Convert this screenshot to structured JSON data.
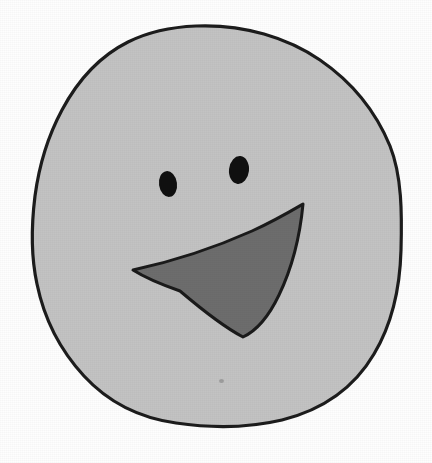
{
  "artwork": {
    "title": "Hand-drawn smiley face",
    "medium": "scanned line drawing",
    "canvas": {
      "width": 432,
      "height": 463
    },
    "background_color": "#fefefe"
  },
  "palette": {
    "background": "#fefefe",
    "face_fill": "#c3c3c3",
    "outline_stroke": "#1c1c1c",
    "eye_fill": "#101010",
    "mouth_fill": "#6d6d6d",
    "mouth_stroke": "#1a1a1a",
    "speck": "#8a8a8a"
  },
  "shapes": {
    "face": {
      "name": "face-outline",
      "description": "irregular hand-drawn roundish head outline",
      "fill": "#c3c3c3",
      "stroke": "#1c1c1c",
      "stroke_width": 3.2,
      "bounds": {
        "left": 32,
        "top": 25,
        "right": 402,
        "bottom": 427
      },
      "path": "M 196 26 C 244 24 288 38 320 60 C 352 82 376 112 390 146 C 402 176 402 214 401 250 C 400 288 392 324 374 354 C 354 388 322 410 282 420 C 248 428 210 428 176 423 C 140 418 108 402 84 376 C 60 350 44 318 37 284 C 30 252 32 220 35 196 C 39 166 48 136 62 110 C 78 80 100 56 128 42 C 150 31 172 27 196 26 Z"
    },
    "eye_left": {
      "name": "left-eye",
      "description": "small dark ellipse, lower and to the left",
      "fill": "#101010",
      "cx": 168,
      "cy": 184,
      "rx": 9,
      "ry": 13,
      "rotation": -8
    },
    "eye_right": {
      "name": "right-eye",
      "description": "slightly larger dark ellipse, higher and to the right",
      "fill": "#101010",
      "cx": 239,
      "cy": 170,
      "rx": 10,
      "ry": 14,
      "rotation": 6
    },
    "mouth": {
      "name": "mouth",
      "description": "curved crescent / triangular smile, medium gray fill with dark outline",
      "fill": "#6d6d6d",
      "stroke": "#1a1a1a",
      "stroke_width": 3,
      "vertices": {
        "left_tip": {
          "x": 133,
          "y": 270
        },
        "top_right_tip": {
          "x": 303,
          "y": 204
        },
        "bottom_vertex": {
          "x": 243,
          "y": 337
        }
      },
      "path": "M 133 270 C 170 262 214 248 252 231 C 274 221 291 211 303 204 C 300 236 292 268 279 295 C 268 318 256 331 243 337 C 222 326 200 308 180 291 C 160 284 144 277 133 270 Z"
    },
    "speck": {
      "name": "paper-speck",
      "description": "faint smudge mark on lower part of face",
      "x": 221,
      "y": 381
    }
  }
}
